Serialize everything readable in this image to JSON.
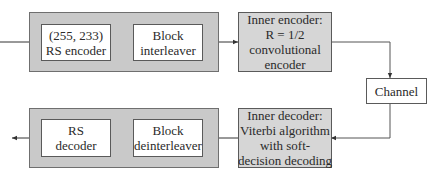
{
  "diagram": {
    "type": "concatenated-coding-block-diagram",
    "encoder_chain": {
      "outer_group": {
        "rs_encoder": {
          "lines": [
            "(255, 233)",
            "RS encoder"
          ]
        },
        "block_interleaver": {
          "lines": [
            "Block",
            "interleaver"
          ]
        }
      },
      "inner_encoder": {
        "lines": [
          "Inner encoder:",
          "R = 1/2",
          "convolutional",
          "encoder"
        ]
      }
    },
    "channel": {
      "label": "Channel"
    },
    "decoder_chain": {
      "inner_decoder": {
        "lines": [
          "Inner decoder:",
          "Viterbi algorithm",
          "with soft-",
          "decision decoding"
        ]
      },
      "outer_group": {
        "block_deinterleaver": {
          "lines": [
            "Block",
            "deinterleaver"
          ]
        },
        "rs_decoder": {
          "lines": [
            "RS",
            "decoder"
          ]
        }
      }
    },
    "colors": {
      "group_fill": "#c9c9c9",
      "shaded_box_fill": "#d6d6d6",
      "box_fill": "#ffffff",
      "line": "#5a5a5a"
    }
  }
}
